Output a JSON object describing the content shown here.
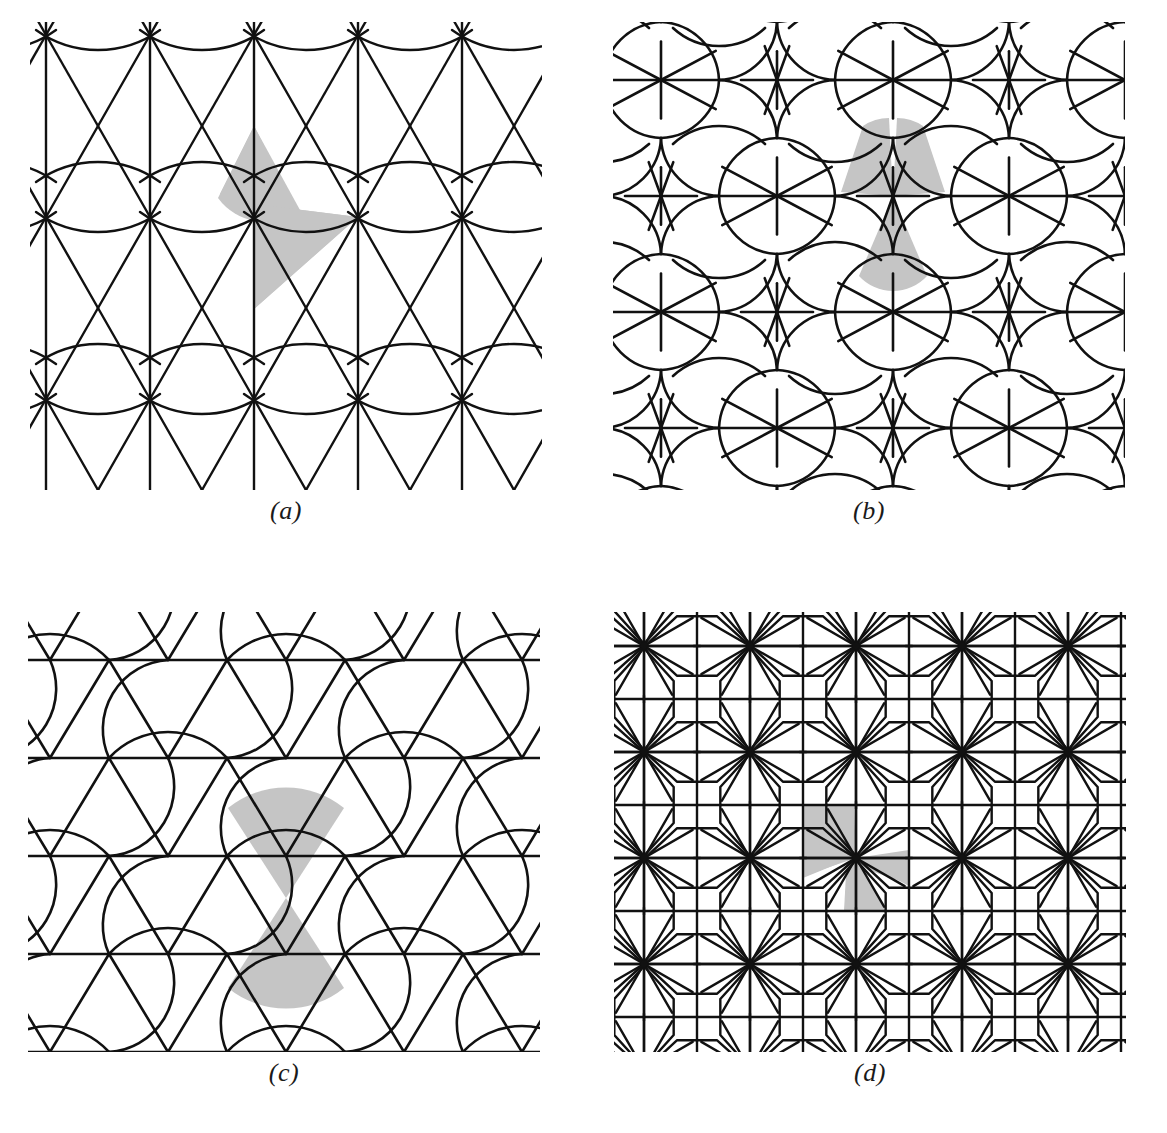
{
  "figure": {
    "background": "#ffffff",
    "ink_color": "#111111",
    "shade_color": "#c5c5c5",
    "panels": [
      {
        "id": "a",
        "caption": "(a)",
        "pattern_name": "triangle-arc-lattice",
        "x": 30,
        "y": 22,
        "width": 510,
        "height": 465,
        "caption_y": 497,
        "stroke_width": 2.4,
        "lattice": {
          "type": "rhombic",
          "cell_width": 104,
          "cell_height": 182,
          "columns": 6,
          "rows": 3,
          "vertical_lines": true,
          "diagonal_zigzags": true,
          "arc_pairs": true,
          "arc_sagitta": 22
        },
        "shaded_cells": [
          {
            "shape": "arc-triangle",
            "col": 2,
            "row": 0
          },
          {
            "shape": "kite",
            "col": 2,
            "row": 0
          }
        ]
      },
      {
        "id": "b",
        "caption": "(b)",
        "pattern_name": "curved-pinwheel-rosette",
        "x": 613,
        "y": 22,
        "width": 512,
        "height": 465,
        "caption_y": 497,
        "stroke_width": 2.6,
        "lattice": {
          "type": "rectangular-offset",
          "cell_width": 116,
          "cell_height": 116,
          "columns": 5,
          "rows": 5,
          "spokes_per_node": 6,
          "arc_radius": 58
        },
        "shaded_cells": [
          {
            "shape": "curved-wedge",
            "position": "upper-left"
          },
          {
            "shape": "curved-wedge",
            "position": "upper-right"
          },
          {
            "shape": "curved-wedge",
            "position": "lower-center"
          }
        ]
      },
      {
        "id": "c",
        "caption": "(c)",
        "pattern_name": "triangular-lattice-with-arcs",
        "x": 28,
        "y": 612,
        "width": 512,
        "height": 440,
        "caption_y": 1062,
        "stroke_width": 2.6,
        "lattice": {
          "type": "triangular",
          "cell_width": 118,
          "cell_height": 100,
          "columns": 6,
          "rows": 5,
          "horizontal_lines": true,
          "arc_sagitta": 26
        },
        "shaded_cells": [
          {
            "shape": "curved-triangle-up",
            "col": 2,
            "row": 2
          },
          {
            "shape": "curved-triangle-down",
            "col": 2,
            "row": 2
          }
        ]
      },
      {
        "id": "d",
        "caption": "(d)",
        "pattern_name": "star-square-lattice",
        "x": 614,
        "y": 612,
        "width": 512,
        "height": 440,
        "caption_y": 1062,
        "stroke_width": 2.4,
        "lattice": {
          "type": "square",
          "grid_step": 53,
          "columns": 10,
          "rows": 9,
          "star_rays": 12,
          "star_spacing": 2
        },
        "shaded_cells": [
          {
            "shape": "pinwheel-blade",
            "index": 0
          },
          {
            "shape": "pinwheel-blade",
            "index": 1
          },
          {
            "shape": "pinwheel-blade",
            "index": 2
          },
          {
            "shape": "pinwheel-blade",
            "index": 3
          }
        ]
      }
    ]
  }
}
